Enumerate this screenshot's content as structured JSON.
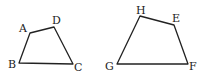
{
  "figure": {
    "stroke_color": "#222222",
    "shapes": [
      {
        "name": "ABCD",
        "vertices": [
          "A",
          "D",
          "C",
          "B"
        ]
      },
      {
        "name": "HEFG",
        "vertices": [
          "H",
          "E",
          "F",
          "G"
        ]
      }
    ],
    "labels": {
      "A": "A",
      "B": "B",
      "C": "C",
      "D": "D",
      "E": "E",
      "F": "F",
      "G": "G",
      "H": "H"
    }
  }
}
